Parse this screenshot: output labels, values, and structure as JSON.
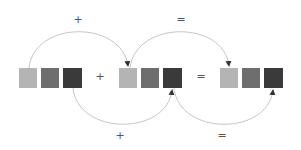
{
  "colors": {
    "light": "#b4b4b4",
    "medium": "#6e6e6e",
    "dark": "#3a3a3a",
    "arc": "#b8b8b8",
    "arrow": "#333333",
    "symbol": "#555555"
  },
  "groups": [
    {
      "name": "group-a",
      "squares": [
        "light",
        "medium",
        "dark"
      ]
    },
    {
      "name": "group-b",
      "squares": [
        "light",
        "medium",
        "dark"
      ]
    },
    {
      "name": "group-c",
      "squares": [
        "light",
        "medium",
        "dark"
      ]
    }
  ],
  "symbols": {
    "top_plus": "+",
    "top_equals": "=",
    "mid_plus": "+",
    "mid_equals": "=",
    "bottom_plus": "+",
    "bottom_equals": "="
  }
}
